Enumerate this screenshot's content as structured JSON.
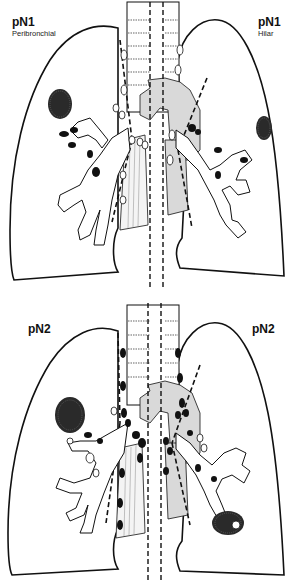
{
  "figure": {
    "panels": [
      {
        "id": "top",
        "left_label": {
          "stage": "pN1",
          "subtitle": "Peribronchial"
        },
        "right_label": {
          "stage": "pN1",
          "subtitle": "Hilar"
        },
        "tumor_left": "upper-right area of right lung",
        "tumor_right": "lateral mid left lung"
      },
      {
        "id": "bottom",
        "left_label": {
          "stage": "pN2",
          "subtitle": ""
        },
        "right_label": {
          "stage": "pN2",
          "subtitle": ""
        },
        "tumor_left": "mid right lung near hilum",
        "tumor_right": "lower left lung"
      }
    ],
    "colors": {
      "outline": "#111111",
      "tumor": "#2a2a2a",
      "mediastinum_fill": "#d9d9d9",
      "node_positive": "#111111",
      "node_negative": "#ffffff",
      "background": "#ffffff"
    }
  }
}
